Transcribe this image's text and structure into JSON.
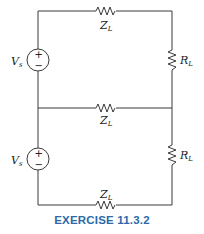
{
  "diagram": {
    "type": "circuit",
    "components": {
      "source_top": {
        "label": "V",
        "sub": "s",
        "plus": "+",
        "minus": "−"
      },
      "source_bottom": {
        "label": "V",
        "sub": "s",
        "plus": "+",
        "minus": "−"
      },
      "line_top": {
        "label": "Z",
        "sub": "L"
      },
      "line_middle": {
        "label": "Z",
        "sub": "L"
      },
      "line_bottom": {
        "label": "Z",
        "sub": "L"
      },
      "load_top": {
        "label": "R",
        "sub": "L"
      },
      "load_bottom": {
        "label": "R",
        "sub": "L"
      }
    },
    "caption": "EXERCISE 11.3.2",
    "caption_color": "#2a6aab"
  }
}
